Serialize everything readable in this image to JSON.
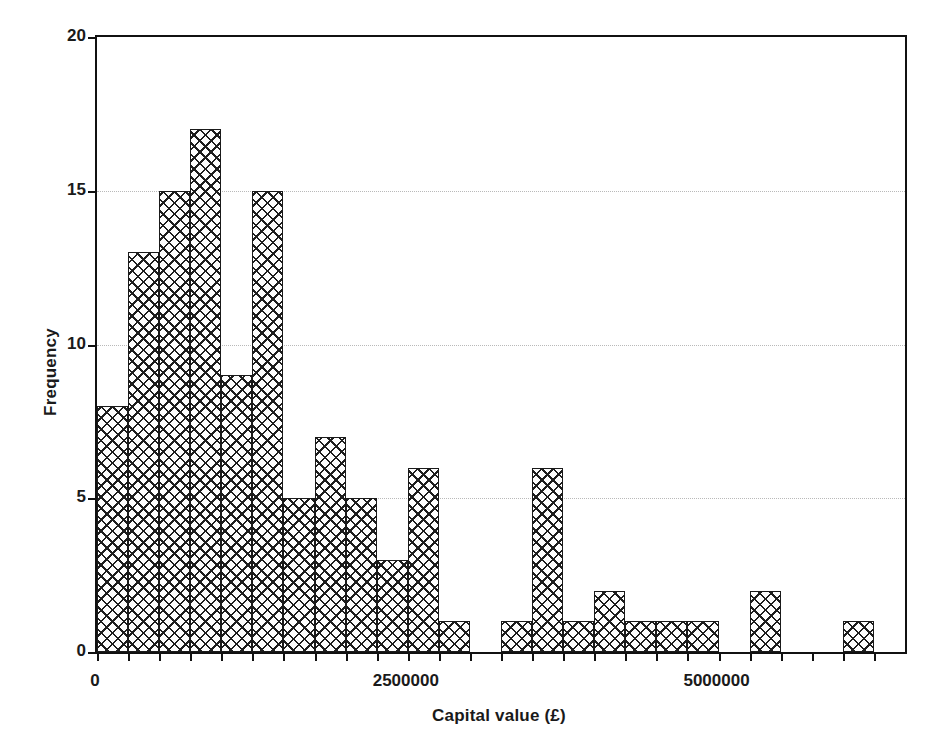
{
  "chart_data": {
    "type": "bar",
    "title": "",
    "xlabel": "Capital value (£)",
    "ylabel": "Frequency",
    "xlim": [
      0,
      6500000
    ],
    "ylim": [
      0,
      20
    ],
    "grid": true,
    "legend": null,
    "bin_width": 250000,
    "categories": [
      "0",
      "250000",
      "500000",
      "750000",
      "1000000",
      "1250000",
      "1500000",
      "1750000",
      "2000000",
      "2250000",
      "2500000",
      "2750000",
      "3000000",
      "3250000",
      "3500000",
      "3750000",
      "4000000",
      "4250000",
      "4500000",
      "4750000",
      "5000000",
      "5250000",
      "5500000",
      "5750000",
      "6000000"
    ],
    "values": [
      8,
      13,
      15,
      17,
      9,
      15,
      5,
      7,
      5,
      3,
      6,
      1,
      0,
      1,
      6,
      1,
      2,
      1,
      1,
      1,
      0,
      2,
      0,
      0,
      1
    ],
    "x_tick_values": [
      0,
      2500000,
      5000000
    ],
    "x_tick_labels": [
      "0",
      "2500000",
      "5000000"
    ],
    "y_tick_values": [
      0,
      5,
      10,
      15,
      20
    ],
    "y_tick_labels": [
      "0",
      "5",
      "10",
      "15",
      "20"
    ],
    "bar_fill_pattern": "cross-hatch",
    "bar_edge_color": "#1a1a1a",
    "grid_color": "#b9b9b9",
    "axis_color": "#111111"
  }
}
